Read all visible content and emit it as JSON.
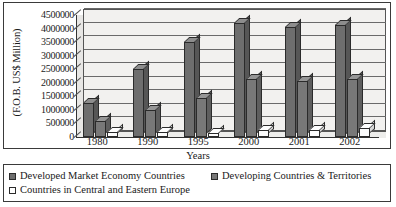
{
  "chart_data": {
    "type": "bar",
    "title": "",
    "xlabel": "Years",
    "ylabel": "(F.O.B. US$ Million)",
    "categories": [
      "1980",
      "1990",
      "1995",
      "2000",
      "2001",
      "2002"
    ],
    "series": [
      {
        "name": "Developed Market Economy Countries",
        "color": "#6e6e6e",
        "values": [
          1250000,
          2500000,
          3500000,
          4200000,
          4050000,
          4150000
        ]
      },
      {
        "name": "Developing Countries & Territories",
        "color": "#787878",
        "values": [
          600000,
          1000000,
          1450000,
          2150000,
          2050000,
          2150000
        ]
      },
      {
        "name": "Countries in Central and Eastern Europe",
        "color": "#ffffff",
        "values": [
          170000,
          170000,
          160000,
          250000,
          270000,
          320000
        ]
      }
    ],
    "ylim": [
      0,
      4500000
    ],
    "ytick_step": 500000,
    "yticks": [
      "4500000",
      "4000000",
      "3500000",
      "3000000",
      "2500000",
      "2000000",
      "1500000",
      "1000000",
      "500000",
      "0"
    ],
    "grid": true,
    "legend_position": "bottom",
    "style": "3d-column"
  },
  "legend": {
    "items": [
      {
        "label": "Developed Market Economy Countries",
        "swatch": "filled-dark-square"
      },
      {
        "label": "Developing Countries & Territories",
        "swatch": "filled-dark-square"
      },
      {
        "label": "Countries in Central and Eastern Europe",
        "swatch": "empty-white-square"
      }
    ]
  }
}
